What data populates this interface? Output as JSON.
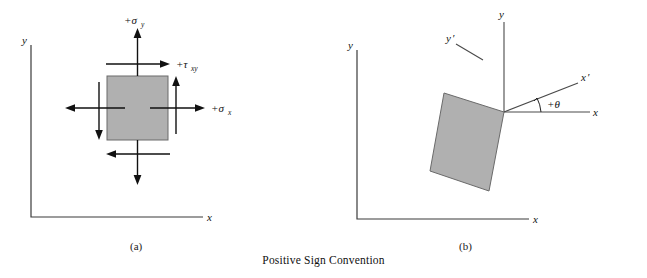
{
  "figure": {
    "caption": "Positive Sign Convention",
    "background_color": "#ffffff",
    "element_fill_color": "#b0b0b0",
    "element_stroke_color": "#6a6a6a",
    "line_color": "#3b3b3b"
  },
  "panel_a": {
    "label": "(a)",
    "axis_y_label": "y",
    "axis_x_label": "x",
    "stress_sigma_y": "+σ",
    "stress_sigma_y_sub": "y",
    "stress_tau_xy": "+τ",
    "stress_tau_xy_sub": "xy",
    "stress_sigma_x": "+σ",
    "stress_sigma_x_sub": "x",
    "description": "Unrotated stress element with positive normal stresses sigma-x, sigma-y and positive shear stress tau-xy"
  },
  "panel_b": {
    "label": "(b)",
    "axis_y_label": "y",
    "axis_x_label": "x",
    "local_y_label": "y",
    "local_y_prime": "′",
    "local_x_label": "x",
    "local_x_prime": "′",
    "angle_label": "+θ",
    "rotation_angle_deg": 22,
    "description": "Rotated stress element showing local x-prime, y-prime axes inclined at positive angle theta from the x axis"
  }
}
